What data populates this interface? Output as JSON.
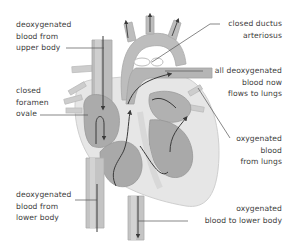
{
  "diagram": {
    "colors": {
      "background": "#ffffff",
      "vessel_fill": "#b9b9b9",
      "vessel_light": "#d6d6d6",
      "heart_wall": "#e4e4e4",
      "chamber": "#a9a9a9",
      "arrow": "#3a3a3a",
      "leader_line": "#555555",
      "text": "#3c3c3c"
    },
    "labels": [
      {
        "id": "upper-body",
        "lines": [
          "deoxygenated",
          "blood from",
          "upper body"
        ]
      },
      {
        "id": "foramen-ovale",
        "lines": [
          "closed",
          "foramen",
          "ovale"
        ]
      },
      {
        "id": "lower-body-in",
        "lines": [
          "deoxygenated",
          "blood from",
          "lower body"
        ]
      },
      {
        "id": "ductus-arteriosus",
        "lines": [
          "closed ductus",
          "arteriosus"
        ]
      },
      {
        "id": "to-lungs",
        "lines": [
          "all deoxygenated",
          "blood now",
          "flows to lungs"
        ]
      },
      {
        "id": "from-lungs",
        "lines": [
          "oxygenated",
          "blood",
          "from lungs"
        ]
      },
      {
        "id": "lower-body-out",
        "lines": [
          "oxygenated",
          "blood to lower body"
        ]
      }
    ]
  }
}
